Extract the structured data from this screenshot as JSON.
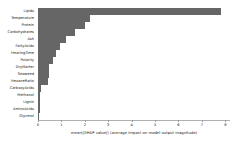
{
  "chart_data": {
    "type": "bar",
    "orientation": "horizontal",
    "title": "",
    "subtitle": "",
    "xlabel": "mean(|SHAP value|) (average impact on model output magnitude)",
    "ylabel": "",
    "categories": [
      "Lipids",
      "Temperature",
      "Protein",
      "Carbohydrates",
      "Ash",
      "FattyAcids",
      "HeatingTime",
      "Polarity",
      "DryMatter",
      "Seaweed",
      "HexaneRatio",
      "CarboxyAcids",
      "Methanol",
      "Lignin",
      "AminoAcids",
      "Glycerol"
    ],
    "values": [
      7.8,
      2.2,
      2.0,
      1.6,
      1.2,
      0.95,
      0.75,
      0.62,
      0.48,
      0.45,
      0.42,
      0.13,
      0.1,
      0.08,
      0.07,
      0.01
    ],
    "xlim": [
      0,
      8.2
    ],
    "xticks": [
      0,
      1,
      2,
      3,
      4,
      5,
      6,
      7,
      8
    ],
    "xticklabels": [
      "0",
      "1",
      "2",
      "3",
      "4",
      "5",
      "6",
      "7",
      "8"
    ],
    "grid": false,
    "legend": null,
    "bar_color": "#666666",
    "background_color": "#ffffff",
    "axis_color": "#b0b0b0"
  }
}
